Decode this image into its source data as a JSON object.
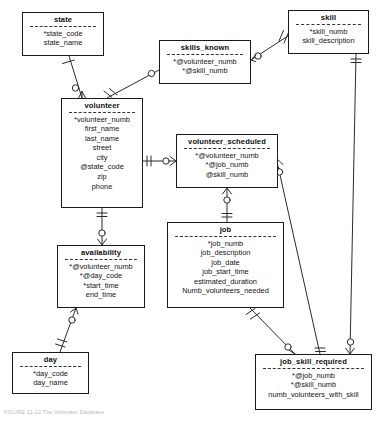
{
  "diagram": {
    "notation": "crow's-foot (IE) entity-relationship diagram",
    "caption": "FIGURE 11-12  The Volunteer Database",
    "line_color": "#2b2b2b",
    "box_border_color": "#1b1b1b",
    "background": "#ffffff",
    "legend": {
      "asterisk_meaning": "* = primary key component",
      "at_meaning": "@ = foreign key"
    }
  },
  "entities": [
    {
      "id": "state",
      "name": "state",
      "attributes": [
        "*state_code",
        "state_name"
      ],
      "x": 22,
      "y": 12,
      "w": 82,
      "h": 44
    },
    {
      "id": "skills_known",
      "name": "skills_known",
      "attributes": [
        "*@volunteer_numb",
        "*@skill_numb"
      ],
      "x": 159,
      "y": 40,
      "w": 92,
      "h": 44
    },
    {
      "id": "skill",
      "name": "skill",
      "attributes": [
        "*skill_numb",
        "skill_description"
      ],
      "x": 288,
      "y": 10,
      "w": 81,
      "h": 44
    },
    {
      "id": "volunteer",
      "name": "volunteer",
      "attributes": [
        "*volunteer_numb",
        "first_name",
        "last_name",
        "street",
        "city",
        "@state_code",
        "zip",
        "phone"
      ],
      "x": 61,
      "y": 98,
      "w": 82,
      "h": 110
    },
    {
      "id": "volunteer_scheduled",
      "name": "volunteer_scheduled",
      "attributes": [
        "*@volunteer_numb",
        "*@job_numb",
        "@skill_numb"
      ],
      "x": 176,
      "y": 134,
      "w": 102,
      "h": 54
    },
    {
      "id": "availability",
      "name": "availability",
      "attributes": [
        "*@volunteer_numb",
        "*@day_code",
        "*start_time",
        "end_time"
      ],
      "x": 57,
      "y": 245,
      "w": 88,
      "h": 63
    },
    {
      "id": "job",
      "name": "job",
      "attributes": [
        "*job_numb",
        "job_description",
        "job_date",
        "job_start_time",
        "estimated_duration",
        "Numb_volunteers_needed"
      ],
      "x": 167,
      "y": 222,
      "w": 117,
      "h": 86
    },
    {
      "id": "day",
      "name": "day",
      "attributes": [
        "*day_code",
        "day_name"
      ],
      "x": 12,
      "y": 352,
      "w": 77,
      "h": 42
    },
    {
      "id": "job_skill_required",
      "name": "job_skill_required",
      "attributes": [
        "*@job_numb",
        "*@skill_numb",
        "numb_volunteers_with_skill"
      ],
      "x": 255,
      "y": 354,
      "w": 117,
      "h": 56
    }
  ],
  "relationships": [
    {
      "id": "state-volunteer",
      "from": "state",
      "to": "volunteer",
      "from_card": "one-mandatory",
      "to_card": "zero-or-many"
    },
    {
      "id": "volunteer-skills_known",
      "from": "volunteer",
      "to": "skills_known",
      "from_card": "one-mandatory",
      "to_card": "zero-or-many"
    },
    {
      "id": "skill-skills_known",
      "from": "skill",
      "to": "skills_known",
      "from_card": "one-mandatory",
      "to_card": "zero-or-many"
    },
    {
      "id": "volunteer-volunteer_scheduled",
      "from": "volunteer",
      "to": "volunteer_scheduled",
      "from_card": "one-mandatory",
      "to_card": "zero-or-many"
    },
    {
      "id": "volunteer-availability",
      "from": "volunteer",
      "to": "availability",
      "from_card": "one-mandatory",
      "to_card": "zero-or-many"
    },
    {
      "id": "availability-day",
      "from": "day",
      "to": "availability",
      "from_card": "one-mandatory",
      "to_card": "zero-or-many"
    },
    {
      "id": "job-volunteer_scheduled",
      "from": "job",
      "to": "volunteer_scheduled",
      "from_card": "one-mandatory",
      "to_card": "zero-or-many"
    },
    {
      "id": "job-job_skill_required",
      "from": "job",
      "to": "job_skill_required",
      "from_card": "one-mandatory",
      "to_card": "zero-or-many"
    },
    {
      "id": "skill-job_skill_required",
      "from": "skill",
      "to": "job_skill_required",
      "from_card": "one-mandatory",
      "to_card": "zero-or-many"
    },
    {
      "id": "volunteer_scheduled-job_skill_required",
      "from": "volunteer_scheduled",
      "to": "job_skill_required",
      "from_card": "one-mandatory",
      "to_card": "one-mandatory"
    }
  ]
}
